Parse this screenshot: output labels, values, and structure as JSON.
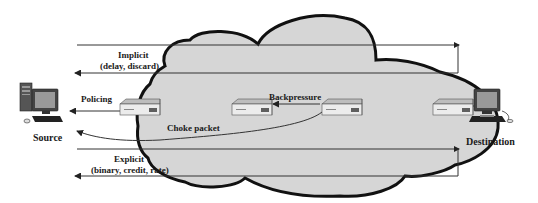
{
  "diagram": {
    "type": "congestion-control-mechanisms",
    "colors": {
      "cloud_fill": "#d6d6d6",
      "cloud_stroke": "#111111",
      "line": "#333333",
      "text": "#1a1a1a",
      "device_body": "#e8e8e8",
      "device_shadow": "#7a7a7a"
    },
    "nodes": {
      "source": {
        "label": "Source",
        "icon": "desktop-computer-icon"
      },
      "destination": {
        "label": "Destination",
        "icon": "desktop-computer-icon"
      },
      "routers": [
        {
          "id": "router-1",
          "icon": "router-icon"
        },
        {
          "id": "router-2",
          "icon": "router-icon"
        },
        {
          "id": "router-3",
          "icon": "router-icon"
        },
        {
          "id": "router-4",
          "icon": "router-icon"
        }
      ],
      "network": {
        "icon": "cloud-icon"
      }
    },
    "labels": {
      "implicit_title": "Implicit",
      "implicit_sub": "(delay, discard)",
      "policing": "Policing",
      "backpressure": "Backpressure",
      "choke_packet": "Choke packet",
      "explicit_title": "Explicit",
      "explicit_sub": "(binary, credit, rate)"
    },
    "edges": [
      {
        "from": "source",
        "to": "destination",
        "label": "Implicit",
        "kind": "loop-top"
      },
      {
        "from": "destination",
        "to": "source",
        "label": "(delay, discard)",
        "kind": "loop-return"
      },
      {
        "from": "router-1",
        "to": "source",
        "label": "Policing"
      },
      {
        "from": "router-3",
        "to": "router-2",
        "label": "Backpressure"
      },
      {
        "from": "router-3",
        "to": "source",
        "label": "Choke packet",
        "kind": "curve"
      },
      {
        "from": "source",
        "to": "destination",
        "label": "Explicit",
        "kind": "loop-top"
      },
      {
        "from": "destination",
        "to": "source",
        "label": "(binary, credit, rate)",
        "kind": "loop-return"
      }
    ]
  }
}
